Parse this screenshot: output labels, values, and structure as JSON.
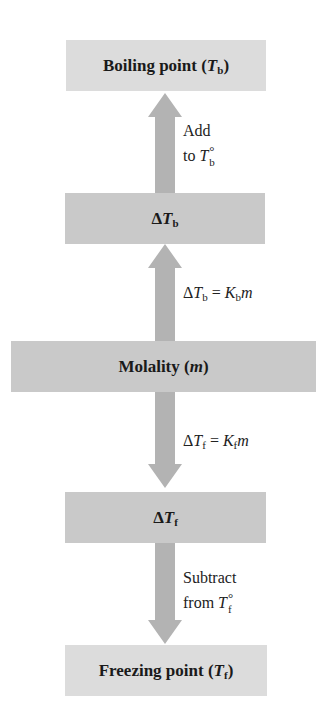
{
  "diagram": {
    "colors": {
      "end_box": "#dcdcdc",
      "mid_box": "#c9c9c9",
      "arrow": "#b3b3b3",
      "text": "#1a1a1a"
    },
    "nodes": {
      "boiling_point": {
        "label": "Boiling point (",
        "var": "T",
        "sub": "b",
        "close": ")"
      },
      "delta_tb": {
        "prefix": "Δ",
        "var": "T",
        "sub": "b"
      },
      "molality": {
        "label": "Molality (",
        "var": "m",
        "close": ")"
      },
      "delta_tf": {
        "prefix": "Δ",
        "var": "T",
        "sub": "f"
      },
      "freezing_point": {
        "label": "Freezing point (",
        "var": "T",
        "sub": "f",
        "close": ")"
      }
    },
    "edges": {
      "add": {
        "direction": "up",
        "from": "delta_tb",
        "to": "boiling_point",
        "line1": "Add",
        "line2_prefix": "to ",
        "var": "T",
        "sup": "°",
        "sub": "b"
      },
      "eq_b": {
        "direction": "up",
        "from": "molality",
        "to": "delta_tb",
        "lhs_prefix": "Δ",
        "lhs_var": "T",
        "lhs_sub": "b",
        "eq": " = ",
        "rhs_var": "K",
        "rhs_sub": "b",
        "rhs_tail": "m"
      },
      "eq_f": {
        "direction": "down",
        "from": "molality",
        "to": "delta_tf",
        "lhs_prefix": "Δ",
        "lhs_var": "T",
        "lhs_sub": "f",
        "eq": " = ",
        "rhs_var": "K",
        "rhs_sub": "f",
        "rhs_tail": "m"
      },
      "subtract": {
        "direction": "down",
        "from": "delta_tf",
        "to": "freezing_point",
        "line1": "Subtract",
        "line2_prefix": "from ",
        "var": "T",
        "sup": "°",
        "sub": "f"
      }
    }
  }
}
